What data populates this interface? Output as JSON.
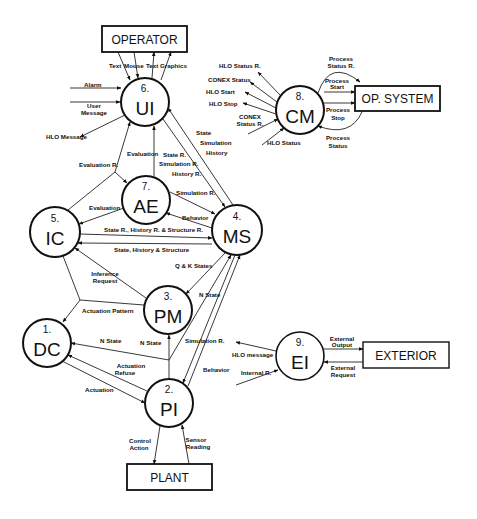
{
  "diagram": {
    "type": "data-flow-diagram",
    "processes": [
      {
        "id": "dc",
        "number": "1.",
        "label": "DC",
        "cx": 47,
        "cy": 343
      },
      {
        "id": "pi",
        "number": "2.",
        "label": "PI",
        "cx": 169,
        "cy": 403
      },
      {
        "id": "pm",
        "number": "3.",
        "label": "PM",
        "cx": 168,
        "cy": 310
      },
      {
        "id": "ms",
        "number": "4.",
        "label": "MS",
        "cx": 237,
        "cy": 230
      },
      {
        "id": "ic",
        "number": "5.",
        "label": "IC",
        "cx": 55,
        "cy": 232
      },
      {
        "id": "ui",
        "number": "6.",
        "label": "UI",
        "cx": 145,
        "cy": 102
      },
      {
        "id": "ae",
        "number": "7.",
        "label": "AE",
        "cx": 146,
        "cy": 200
      },
      {
        "id": "cm",
        "number": "8.",
        "label": "CM",
        "cx": 300,
        "cy": 110
      },
      {
        "id": "ei",
        "number": "9.",
        "label": "EI",
        "cx": 300,
        "cy": 356
      }
    ],
    "externals": [
      {
        "id": "operator",
        "label": "OPERATOR"
      },
      {
        "id": "op_system",
        "label": "OP. SYSTEM"
      },
      {
        "id": "exterior",
        "label": "EXTERIOR"
      },
      {
        "id": "plant",
        "label": "PLANT"
      }
    ],
    "flows": {
      "operator_ui": [
        "Text",
        "Mouse",
        "Text",
        "Graphics"
      ],
      "alarm": "Alarm",
      "user_message": [
        "User",
        "Message"
      ],
      "hlo_message_ui": "HLO Message",
      "evaluation_r": "Evaluation R.",
      "evaluation_ae_ui": "Evaluation",
      "state_r_group": [
        "State R.",
        "Simulation R.",
        "History R."
      ],
      "state_group": [
        "State",
        "Simulation",
        "History"
      ],
      "simulation_r_ae_ms": "Simulation R.",
      "behavior_ms_ae": "Behavior",
      "evaluation_ae_ic": "Evaluation",
      "state_history_structure_r": "State R., History R. & Structure R.",
      "state_history_structure": "State, History & Structure",
      "q_k_states": "Q & K States",
      "inference_request": [
        "Inference",
        "Request"
      ],
      "actuation_pattern": "Actuation Pattern",
      "n_state_ms_pm": "N State",
      "n_state_dc": "N State",
      "n_state_pm": "N State",
      "simulation_r_pi": "Simulation R.",
      "behavior_pi": "Behavior",
      "actuation_refuse": [
        "Actuation",
        "Refuse"
      ],
      "actuation": "Actuation",
      "control_action": [
        "Control",
        "Action"
      ],
      "sensor_reading": [
        "Sensor",
        "Reading"
      ],
      "cm_hlo_status_r": "HLO Status R.",
      "cm_conex_status": "CONEX Status",
      "cm_hlo_start": "HLO Start",
      "cm_hlo_stop": "HLO Stop",
      "cm_conex_status_r": [
        "CONEX",
        "Status R."
      ],
      "cm_hlo_status": "HLO Status",
      "process_status_r": [
        "Process",
        "Status R."
      ],
      "process_start": [
        "Process",
        "Start"
      ],
      "process_stop": [
        "Process",
        "Stop"
      ],
      "process_status": [
        "Process",
        "Status"
      ],
      "ei_hlo_message": "HLO message",
      "ei_internal_r": "Internal R.",
      "external_output": [
        "External",
        "Output"
      ],
      "external_request": [
        "External",
        "Request"
      ]
    }
  }
}
